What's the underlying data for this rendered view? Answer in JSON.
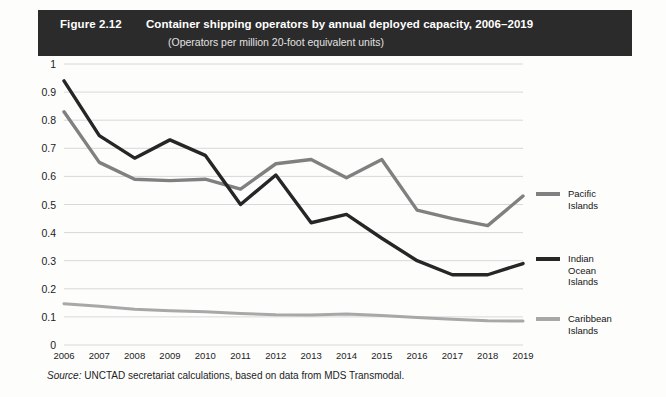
{
  "figure": {
    "number": "Figure 2.12",
    "title": "Container shipping operators by annual deployed capacity, 2006–2019",
    "subtitle": "(Operators per million 20-foot equivalent units)",
    "source_label": "Source:",
    "source_text": " UNCTAD secretariat calculations, based on data from MDS Transmodal."
  },
  "colors": {
    "title_bar_bg": "#2b2b2b",
    "title_bar_fg": "#ffffff",
    "pacific": "#808080",
    "indian_ocean": "#262626",
    "caribbean": "#a8a8a8",
    "gridline": "#d8d8d8",
    "text": "#1c1c1c",
    "page_bg": "#fdfdfc"
  },
  "chart_data": {
    "type": "line",
    "title": "Container shipping operators by annual deployed capacity, 2006–2019",
    "subtitle": "(Operators per million 20-foot equivalent units)",
    "xlabel": "",
    "ylabel": "",
    "grid": true,
    "legend_position": "right",
    "ylim": [
      0,
      1
    ],
    "yticks": [
      0,
      0.1,
      0.2,
      0.3,
      0.4,
      0.5,
      0.6,
      0.7,
      0.8,
      0.9,
      1
    ],
    "ytick_labels": [
      "0",
      "0.1",
      "0.2",
      "0.3",
      "0.4",
      "0.5",
      "0.6",
      "0.7",
      "0.8",
      "0.9",
      "1"
    ],
    "categories": [
      "2006",
      "2007",
      "2008",
      "2009",
      "2010",
      "2011",
      "2012",
      "2013",
      "2014",
      "2015",
      "2016",
      "2017",
      "2018",
      "2019"
    ],
    "x": [
      2006,
      2007,
      2008,
      2009,
      2010,
      2011,
      2012,
      2013,
      2014,
      2015,
      2016,
      2017,
      2018,
      2019
    ],
    "series": [
      {
        "name": "Pacific Islands",
        "color": "#808080",
        "values": [
          0.83,
          0.65,
          0.59,
          0.585,
          0.59,
          0.555,
          0.645,
          0.66,
          0.595,
          0.66,
          0.48,
          0.45,
          0.425,
          0.53
        ]
      },
      {
        "name": "Indian Ocean Islands",
        "color": "#262626",
        "values": [
          0.94,
          0.745,
          0.665,
          0.73,
          0.675,
          0.5,
          0.605,
          0.435,
          0.465,
          0.38,
          0.3,
          0.25,
          0.25,
          0.29
        ]
      },
      {
        "name": "Caribbean Islands",
        "color": "#a8a8a8",
        "values": [
          0.147,
          0.138,
          0.127,
          0.122,
          0.118,
          0.112,
          0.108,
          0.107,
          0.11,
          0.105,
          0.098,
          0.092,
          0.086,
          0.085
        ]
      }
    ]
  },
  "legend": [
    {
      "label": "Pacific Islands",
      "color": "#808080"
    },
    {
      "label": "Indian Ocean\nIslands",
      "color": "#262626"
    },
    {
      "label": "Caribbean\nIslands",
      "color": "#a8a8a8"
    }
  ]
}
